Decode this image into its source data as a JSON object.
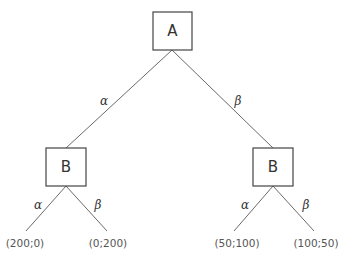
{
  "diagram": {
    "type": "game-tree",
    "root": {
      "label": "A",
      "edges": [
        {
          "label": "α"
        },
        {
          "label": "β"
        }
      ]
    },
    "children": [
      {
        "label": "B",
        "edges": [
          {
            "label": "α",
            "payoff": "(200;0)"
          },
          {
            "label": "β",
            "payoff": "(0;200)"
          }
        ]
      },
      {
        "label": "B",
        "edges": [
          {
            "label": "α",
            "payoff": "(50;100)"
          },
          {
            "label": "β",
            "payoff": "(100;50)"
          }
        ]
      }
    ]
  }
}
